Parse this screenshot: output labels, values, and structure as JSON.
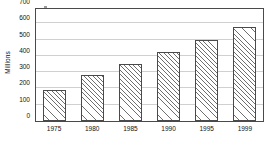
{
  "chart_data": {
    "type": "bar",
    "title": "",
    "xlabel": "",
    "ylabel": "Millions",
    "categories": [
      "1975",
      "1980",
      "1985",
      "1990",
      "1995",
      "1999"
    ],
    "values": [
      190,
      283,
      350,
      425,
      500,
      580
    ],
    "ylim": [
      0,
      700
    ],
    "yticks": [
      0,
      100,
      200,
      300,
      400,
      500,
      600,
      700
    ],
    "ytick_labels": [
      "0",
      "100",
      "200",
      "300",
      "400",
      "500",
      "600",
      "700"
    ],
    "grid": "horizontal",
    "legend": "none",
    "series": [
      {
        "name": "Millions",
        "values": [
          190,
          283,
          350,
          425,
          500,
          580
        ]
      }
    ],
    "style": {
      "bar_fill": "#ffffff",
      "bar_hatch": "diagonal-forward",
      "bar_edge": "#4a4a4a",
      "gridline_color": "#d0d0d0",
      "axis_color": "#4a4a4a",
      "background": "#ffffff",
      "text_color": "#111111"
    }
  }
}
